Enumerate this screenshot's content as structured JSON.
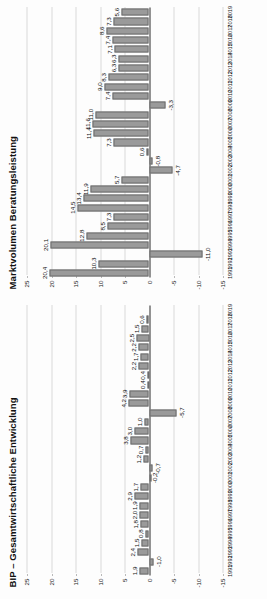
{
  "page": {
    "background": "#fdfdfd",
    "bar_color": "#9a9a9a",
    "bar_border_color": "#6d6d6d",
    "axis_color": "#2b2b2b",
    "grid_color": "#b9b9b9"
  },
  "charts": [
    {
      "id": "bip-gesamtwirtschaftliche-entwicklung",
      "title": "BIP – Gesamtwirtschaftliche Entwicklung",
      "ylabels": [
        "25",
        "20",
        "15",
        "10",
        "5",
        "0",
        "-5",
        "-10",
        "-15"
      ],
      "yvalues": [
        25,
        20,
        15,
        10,
        5,
        0,
        -5,
        -10,
        -15
      ],
      "ylim": [
        -15,
        25
      ],
      "years": [
        "1991",
        "1992",
        "1993",
        "1994",
        "1995",
        "1996",
        "1997",
        "1998",
        "1999",
        "2000",
        "2001",
        "2002",
        "2003",
        "2004",
        "2005",
        "2006",
        "2007",
        "2008",
        "2009",
        "2010",
        "2011",
        "2012",
        "2013",
        "2014",
        "2015",
        "2016",
        "2017",
        "2018",
        "2019"
      ],
      "values": [
        1.9,
        -1.0,
        2.4,
        1.5,
        0.8,
        1.8,
        2.0,
        1.9,
        2.9,
        1.7,
        -0.2,
        -0.7,
        1.2,
        0.7,
        3.8,
        3.0,
        1.0,
        -5.7,
        4.2,
        3.9,
        0.4,
        0.4,
        2.2,
        1.7,
        2.2,
        2.5,
        1.5,
        0.6,
        0.0
      ],
      "labels": [
        "1,9",
        "-1,0",
        "2,4",
        "1,5",
        "0,8",
        "1,8",
        "2,0",
        "1,9",
        "2,9",
        "1,7",
        "-0,2",
        "-0,7",
        "1,2",
        "0,7",
        "3,8",
        "3,0",
        "1,0",
        "-5,7",
        "4,2",
        "3,9",
        "0,4",
        "0,4",
        "2,2",
        "1,7",
        "2,2",
        "2,5",
        "1,5",
        "0,6",
        ""
      ]
    },
    {
      "id": "marktvolumen-beratungsleistung",
      "title": "Marktvolumen Beratungsleistung",
      "ylabels": [
        "25",
        "20",
        "15",
        "10",
        "5",
        "0",
        "-5",
        "-10",
        "-15"
      ],
      "yvalues": [
        25,
        20,
        15,
        10,
        5,
        0,
        -5,
        -10,
        -15
      ],
      "ylim": [
        -15,
        25
      ],
      "years": [
        "1991",
        "1992",
        "1993",
        "1994",
        "1995",
        "1996",
        "1997",
        "1998",
        "1999",
        "2000",
        "2001",
        "2002",
        "2003",
        "2004",
        "2005",
        "2006",
        "2007",
        "2008",
        "2009",
        "2010",
        "2011",
        "2012",
        "2013",
        "2014",
        "2015",
        "2016",
        "2017",
        "2018",
        "2019"
      ],
      "values": [
        20.4,
        10.3,
        -11.0,
        20.1,
        12.8,
        8.5,
        7.3,
        14.5,
        13.4,
        11.9,
        5.7,
        -4.7,
        -0.8,
        0.6,
        7.3,
        11.4,
        11.6,
        11.0,
        -3.3,
        7.4,
        9.0,
        8.3,
        6.3,
        6.3,
        7.1,
        7.4,
        8.6,
        7.3,
        5.6
      ],
      "labels": [
        "20,4",
        "10,3",
        "-11,0",
        "20,1",
        "12,8",
        "8,5",
        "7,3",
        "14,5",
        "13,4",
        "11,9",
        "5,7",
        "-4,7",
        "-0,8",
        "0,6",
        "7,3",
        "11,4",
        "11,6",
        "11,0",
        "-3,3",
        "7,4",
        "9,0",
        "8,3",
        "6,3",
        "6,3",
        "7,1",
        "7,4",
        "8,6",
        "7,3",
        "5,6"
      ]
    }
  ],
  "chart_data": [
    {
      "type": "bar",
      "title": "BIP – Gesamtwirtschaftliche Entwicklung",
      "xlabel": "",
      "ylabel": "",
      "ylim": [
        -15,
        25
      ],
      "grid": true,
      "legend": "none",
      "categories": [
        "1991",
        "1992",
        "1993",
        "1994",
        "1995",
        "1996",
        "1997",
        "1998",
        "1999",
        "2000",
        "2001",
        "2002",
        "2003",
        "2004",
        "2005",
        "2006",
        "2007",
        "2008",
        "2009",
        "2010",
        "2011",
        "2012",
        "2013",
        "2014",
        "2015",
        "2016",
        "2017",
        "2018",
        "2019"
      ],
      "values": [
        1.9,
        -1.0,
        2.4,
        1.5,
        0.8,
        1.8,
        2.0,
        1.9,
        2.9,
        1.7,
        -0.2,
        -0.7,
        1.2,
        0.7,
        3.8,
        3.0,
        1.0,
        -5.7,
        4.2,
        3.9,
        0.4,
        0.4,
        2.2,
        1.7,
        2.2,
        2.5,
        1.5,
        0.6,
        0.0
      ],
      "yticks": [
        25,
        20,
        15,
        10,
        5,
        0,
        -5,
        -10,
        -15
      ]
    },
    {
      "type": "bar",
      "title": "Marktvolumen Beratungsleistung",
      "xlabel": "",
      "ylabel": "",
      "ylim": [
        -15,
        25
      ],
      "grid": true,
      "legend": "none",
      "categories": [
        "1991",
        "1992",
        "1993",
        "1994",
        "1995",
        "1996",
        "1997",
        "1998",
        "1999",
        "2000",
        "2001",
        "2002",
        "2003",
        "2004",
        "2005",
        "2006",
        "2007",
        "2008",
        "2009",
        "2010",
        "2011",
        "2012",
        "2013",
        "2014",
        "2015",
        "2016",
        "2017",
        "2018",
        "2019"
      ],
      "values": [
        20.4,
        10.3,
        -11.0,
        20.1,
        12.8,
        8.5,
        7.3,
        14.5,
        13.4,
        11.9,
        5.7,
        -4.7,
        -0.8,
        0.6,
        7.3,
        11.4,
        11.6,
        11.0,
        -3.3,
        7.4,
        9.0,
        8.3,
        6.3,
        6.3,
        7.1,
        7.4,
        8.6,
        7.3,
        5.6
      ],
      "yticks": [
        25,
        20,
        15,
        10,
        5,
        0,
        -5,
        -10,
        -15
      ]
    }
  ]
}
